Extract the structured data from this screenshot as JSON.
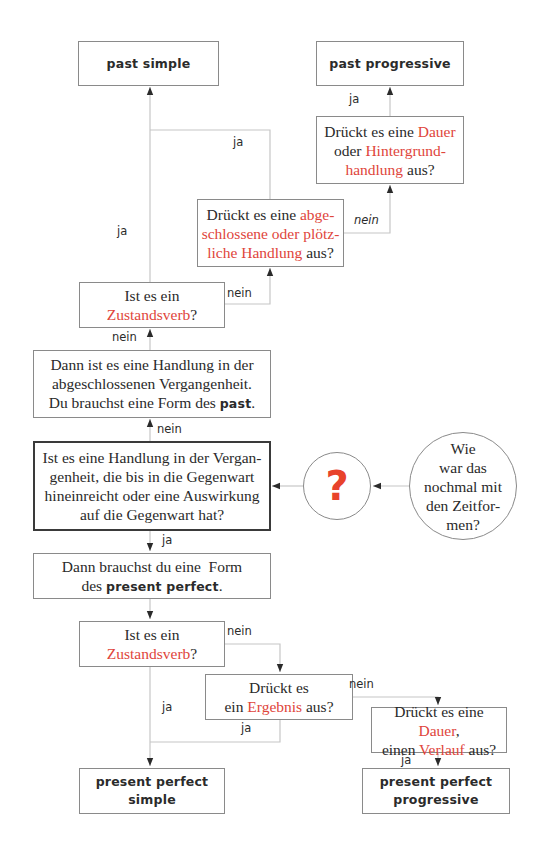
{
  "colors": {
    "highlight": "#e0453b",
    "question_mark": "#e8432b",
    "line": "#c6c6c6",
    "border": "#8a8a8a",
    "arrow": "#2b2b2b"
  },
  "nodes": {
    "past_simple": {
      "text": "past simple"
    },
    "past_progressive": {
      "text": "past progressive"
    },
    "dauer_question": {
      "parts": [
        "Drückt es eine ",
        "Dauer",
        " oder ",
        "Hintergrund-handlung",
        " aus?"
      ],
      "line1a": "Drückt es eine ",
      "line1b": "Dauer",
      "line2a": "oder ",
      "line2b": "Hintergrund-",
      "line3a": "handlung",
      "line3b": " aus?"
    },
    "abgeschlossen_question": {
      "line1a": "Drückt es eine ",
      "line1b": "abge-",
      "line2": "schlossene oder plötz-",
      "line3a": "liche Handlung",
      "line3b": " aus?"
    },
    "zustandsverb_top": {
      "line1": "Ist es ein",
      "line2a": "Zustandsverb",
      "line2b": "?"
    },
    "past_statement": {
      "line1": "Dann ist es eine Handlung in der",
      "line2": "abgeschlossenen Vergangenheit.",
      "line3a": "Du brauchst eine Form des ",
      "line3b": "past",
      "line3c": "."
    },
    "main_question": {
      "line1": "Ist es eine Handlung in der Vergan-",
      "line2": "genheit, die bis in die Gegenwart",
      "line3": "hineinreicht oder eine Auswirkung",
      "line4": "auf die Gegenwart hat?"
    },
    "question_circle": {
      "symbol": "?"
    },
    "start_circle": {
      "line1": "Wie",
      "line2": "war das",
      "line3": "nochmal mit",
      "line4": "den Zeitfor-",
      "line5": "men?"
    },
    "present_perfect_statement": {
      "line1": "Dann brauchst du eine  Form",
      "line2a": "des ",
      "line2b": "present perfect",
      "line2c": "."
    },
    "zustandsverb_bottom": {
      "line1": "Ist es ein",
      "line2a": "Zustandsverb",
      "line2b": "?"
    },
    "ergebnis_question": {
      "line1": "Drückt es",
      "line2a": "ein ",
      "line2b": "Ergebnis",
      "line2c": " aus?"
    },
    "verlauf_question": {
      "line1a": "Drückt es eine ",
      "line1b": "Dauer",
      "line1c": ",",
      "line2a": "einen ",
      "line2b": "Verlauf",
      "line2c": " aus?"
    },
    "present_perfect_simple": {
      "line1": "present perfect",
      "line2": "simple"
    },
    "present_perfect_progressive": {
      "line1": "present perfect",
      "line2": "progressive"
    }
  },
  "labels": {
    "ja_past_progressive": "ja",
    "ja_abgeschlossen": "ja",
    "ja_zustand_top": "ja",
    "nein_abgeschlossen": "nein",
    "nein_zustand_top": "nein",
    "nein_past_statement": "nein",
    "nein_main": "nein",
    "ja_main": "ja",
    "nein_zustand_bottom": "nein",
    "ja_zustand_bottom": "ja",
    "nein_ergebnis": "nein",
    "ja_ergebnis": "ja",
    "ja_verlauf": "ja"
  }
}
